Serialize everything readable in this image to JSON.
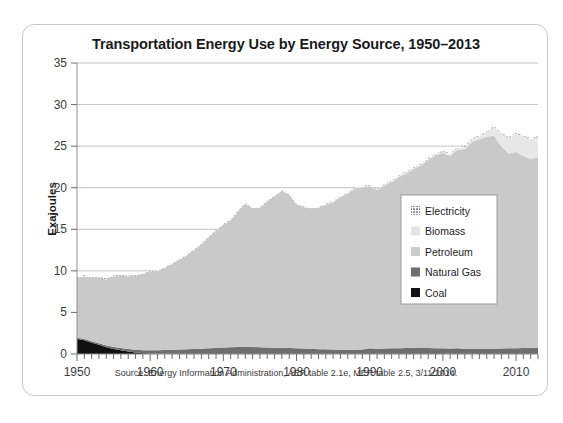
{
  "figure": {
    "title": "Transportation Energy Use by Energy Source, 1950–2013",
    "source_note": "Source: Energy Information Administration, AER table 2.1e, MER table 2.5, 3/11/2014."
  },
  "chart_data": {
    "type": "area",
    "stacked": true,
    "title": "Transportation Energy Use by Energy Source, 1950–2013",
    "subtitle": "",
    "xlabel": "",
    "ylabel": "Exajoules",
    "xlim": [
      1950,
      2013
    ],
    "ylim": [
      0,
      35
    ],
    "ytick_values": [
      0,
      5,
      10,
      15,
      20,
      25,
      30,
      35
    ],
    "ytick_labels": [
      "0",
      "5",
      "10",
      "15",
      "20",
      "25",
      "30",
      "35"
    ],
    "xtick_values": [
      1950,
      1960,
      1970,
      1980,
      1990,
      2000,
      2010
    ],
    "xtick_labels": [
      "1950",
      "1960",
      "1970",
      "1980",
      "1990",
      "2000",
      "2010"
    ],
    "minor_xticks": "every 1 year",
    "grid": "horizontal",
    "legend_position": "center-right",
    "x": [
      1950,
      1951,
      1952,
      1953,
      1954,
      1955,
      1956,
      1957,
      1958,
      1959,
      1960,
      1961,
      1962,
      1963,
      1964,
      1965,
      1966,
      1967,
      1968,
      1969,
      1970,
      1971,
      1972,
      1973,
      1974,
      1975,
      1976,
      1977,
      1978,
      1979,
      1980,
      1981,
      1982,
      1983,
      1984,
      1985,
      1986,
      1987,
      1988,
      1989,
      1990,
      1991,
      1992,
      1993,
      1994,
      1995,
      1996,
      1997,
      1998,
      1999,
      2000,
      2001,
      2002,
      2003,
      2004,
      2005,
      2006,
      2007,
      2008,
      2009,
      2010,
      2011,
      2012,
      2013
    ],
    "series": [
      {
        "name": "Coal",
        "color": "#111111",
        "values": [
          1.8,
          1.65,
          1.35,
          1.1,
          0.8,
          0.6,
          0.45,
          0.3,
          0.18,
          0.1,
          0.05,
          0.03,
          0.02,
          0.01,
          0.01,
          0.0,
          0.0,
          0.0,
          0.0,
          0.0,
          0.0,
          0.0,
          0.0,
          0.0,
          0.0,
          0.0,
          0.0,
          0.0,
          0.0,
          0.0,
          0.0,
          0.0,
          0.0,
          0.0,
          0.0,
          0.0,
          0.0,
          0.0,
          0.0,
          0.0,
          0.0,
          0.0,
          0.0,
          0.0,
          0.0,
          0.0,
          0.0,
          0.0,
          0.0,
          0.0,
          0.0,
          0.0,
          0.0,
          0.0,
          0.0,
          0.0,
          0.0,
          0.0,
          0.0,
          0.0,
          0.0,
          0.0,
          0.0,
          0.0
        ]
      },
      {
        "name": "Natural Gas",
        "color": "#6e6e6e",
        "values": [
          0.14,
          0.16,
          0.18,
          0.2,
          0.22,
          0.25,
          0.28,
          0.3,
          0.33,
          0.36,
          0.4,
          0.43,
          0.46,
          0.5,
          0.53,
          0.56,
          0.6,
          0.64,
          0.68,
          0.72,
          0.77,
          0.8,
          0.83,
          0.86,
          0.84,
          0.8,
          0.78,
          0.76,
          0.74,
          0.72,
          0.7,
          0.66,
          0.62,
          0.58,
          0.56,
          0.54,
          0.52,
          0.5,
          0.52,
          0.54,
          0.68,
          0.63,
          0.66,
          0.68,
          0.7,
          0.72,
          0.75,
          0.78,
          0.72,
          0.7,
          0.68,
          0.65,
          0.68,
          0.63,
          0.62,
          0.6,
          0.62,
          0.64,
          0.66,
          0.68,
          0.7,
          0.72,
          0.74,
          0.76
        ]
      },
      {
        "name": "Petroleum",
        "color": "#c9c9c9",
        "values": [
          7.2,
          7.55,
          7.6,
          7.9,
          7.95,
          8.5,
          8.7,
          8.75,
          8.9,
          9.2,
          9.45,
          9.5,
          9.9,
          10.3,
          10.8,
          11.3,
          11.9,
          12.6,
          13.4,
          14.1,
          14.8,
          15.3,
          16.3,
          17.2,
          16.7,
          16.8,
          17.6,
          18.2,
          18.9,
          18.4,
          17.3,
          17.0,
          16.9,
          17.0,
          17.4,
          17.7,
          18.3,
          18.8,
          19.4,
          19.5,
          19.5,
          19.1,
          19.6,
          20.0,
          20.6,
          21.0,
          21.5,
          21.9,
          22.6,
          23.2,
          23.5,
          23.2,
          23.9,
          24.0,
          24.9,
          25.2,
          25.5,
          25.6,
          24.3,
          23.4,
          23.6,
          23.1,
          22.7,
          22.9
        ]
      },
      {
        "name": "Biomass",
        "color": "#e8e8e8",
        "values": [
          0.0,
          0.0,
          0.0,
          0.0,
          0.0,
          0.0,
          0.0,
          0.0,
          0.0,
          0.0,
          0.0,
          0.0,
          0.0,
          0.0,
          0.0,
          0.0,
          0.0,
          0.0,
          0.0,
          0.0,
          0.0,
          0.0,
          0.0,
          0.0,
          0.0,
          0.0,
          0.0,
          0.0,
          0.0,
          0.0,
          0.02,
          0.03,
          0.04,
          0.05,
          0.06,
          0.07,
          0.08,
          0.09,
          0.1,
          0.11,
          0.12,
          0.12,
          0.13,
          0.13,
          0.14,
          0.16,
          0.12,
          0.13,
          0.14,
          0.15,
          0.16,
          0.18,
          0.22,
          0.28,
          0.36,
          0.42,
          0.6,
          1.1,
          1.6,
          1.9,
          2.2,
          2.4,
          2.4,
          2.45
        ]
      },
      {
        "name": "Electricity",
        "color": "#f7f7f7",
        "pattern": "dotted",
        "values": [
          0.1,
          0.1,
          0.1,
          0.09,
          0.09,
          0.08,
          0.08,
          0.07,
          0.07,
          0.06,
          0.06,
          0.06,
          0.06,
          0.06,
          0.06,
          0.06,
          0.06,
          0.06,
          0.06,
          0.06,
          0.06,
          0.06,
          0.06,
          0.06,
          0.06,
          0.06,
          0.06,
          0.06,
          0.06,
          0.06,
          0.06,
          0.06,
          0.06,
          0.06,
          0.06,
          0.06,
          0.06,
          0.06,
          0.06,
          0.06,
          0.07,
          0.07,
          0.07,
          0.07,
          0.07,
          0.07,
          0.07,
          0.07,
          0.07,
          0.07,
          0.08,
          0.08,
          0.08,
          0.08,
          0.08,
          0.08,
          0.08,
          0.08,
          0.08,
          0.08,
          0.08,
          0.08,
          0.08,
          0.08
        ]
      }
    ],
    "legend": [
      {
        "label": "Electricity",
        "swatch": "dotted",
        "color": "#f7f7f7"
      },
      {
        "label": "Biomass",
        "swatch": "solid",
        "color": "#e4e4e4"
      },
      {
        "label": "Petroleum",
        "swatch": "solid",
        "color": "#cccccc"
      },
      {
        "label": "Natural Gas",
        "swatch": "solid",
        "color": "#6e6e6e"
      },
      {
        "label": "Coal",
        "swatch": "solid",
        "color": "#111111"
      }
    ]
  }
}
